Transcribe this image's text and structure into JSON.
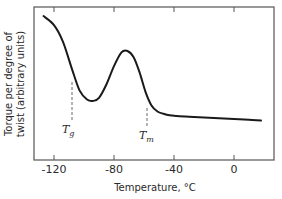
{
  "chart_data": {
    "type": "line",
    "title": "",
    "xlabel": "Temperature, °C",
    "ylabel_line1": "Torque per degree of",
    "ylabel_line2": "twist (arbitrary units)",
    "xlim": [
      -132,
      28
    ],
    "ylim": [
      0,
      100
    ],
    "xticks": [
      -120,
      -80,
      -40,
      0
    ],
    "xtick_labels": [
      "-120",
      "-80",
      "-40",
      "0"
    ],
    "grid": false,
    "legend": null,
    "series": [
      {
        "name": "torque",
        "x": [
          -127,
          -120,
          -114,
          -108,
          -103,
          -98,
          -94,
          -90,
          -85,
          -80,
          -75,
          -71,
          -67,
          -63,
          -59,
          -55,
          -51,
          -47,
          -43,
          -38,
          -30,
          -20,
          -10,
          0,
          10,
          18
        ],
        "y": [
          95,
          89,
          78,
          60,
          46,
          40,
          39,
          41,
          50,
          62,
          71,
          72,
          68,
          58,
          45,
          36,
          32,
          30.5,
          29.5,
          29,
          28.5,
          28,
          27.5,
          27,
          26.5,
          26
        ]
      }
    ],
    "annotations": [
      {
        "label": "T",
        "subscript": "g",
        "x": -108,
        "dashed_line": true
      },
      {
        "label": "T",
        "subscript": "m",
        "x": -58,
        "dashed_line": true
      }
    ]
  },
  "labels": {
    "tg_main": "T",
    "tg_sub": "g",
    "tm_main": "T",
    "tm_sub": "m"
  }
}
